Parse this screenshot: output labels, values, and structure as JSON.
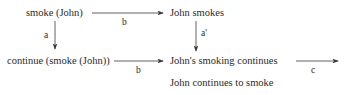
{
  "nodes": {
    "smoke_john": "smoke (John)",
    "john_smokes": "John smokes",
    "continue_smoke_john": "continue (smoke (John))",
    "johns_smoking_continues": "John's smoking continues",
    "john_continues_to_smoke": "John continues to smoke"
  },
  "edges": {
    "top_horizontal": "b",
    "left_vertical": "a",
    "right_vertical": "a'",
    "bottom_horizontal": "b",
    "right_outgoing": "c"
  },
  "colors": {
    "line": "#3a3a3a",
    "text": "#2a2a2a"
  }
}
